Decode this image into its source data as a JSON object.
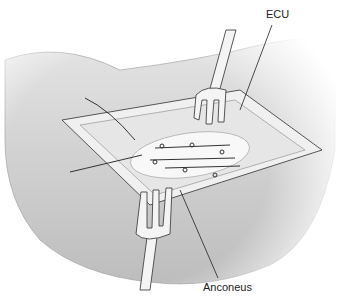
{
  "figure": {
    "labels": [
      {
        "id": "ecu",
        "text": "ECU"
      },
      {
        "id": "anconeus",
        "text": "Anconeus"
      }
    ],
    "colors": {
      "skin": "#d9d9d9",
      "shadow": "#a8a8a8",
      "line": "#333333",
      "tissue": "#eeeeee"
    }
  }
}
